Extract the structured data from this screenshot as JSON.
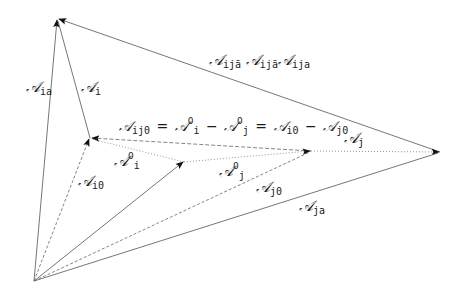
{
  "diagram": {
    "type": "vector-diagram",
    "points": {
      "origin": [
        34,
        281
      ],
      "top": [
        57,
        18
      ],
      "i0": [
        90,
        138
      ],
      "center": [
        184,
        162
      ],
      "j0": [
        311,
        151
      ],
      "right": [
        440,
        152
      ]
    },
    "labels": {
      "A_ia": {
        "base": "𝒜",
        "sub": "ia"
      },
      "A_i": {
        "base": "𝒜",
        "sub": "i"
      },
      "A_i0": {
        "base": "𝒜",
        "sub": "i0"
      },
      "A_i_sup": {
        "base": "𝒜",
        "sub": "i",
        "sup": "0"
      },
      "A_j_sup": {
        "base": "𝒜",
        "sub": "j",
        "sup": "0"
      },
      "A_j0": {
        "base": "𝒜",
        "sub": "j0"
      },
      "A_ja": {
        "base": "𝒜",
        "sub": "ja"
      },
      "A_j": {
        "base": "𝒜",
        "sub": "j"
      },
      "A_ija_top": {
        "text1_base": "𝒜",
        "text1_sub": "ijā",
        "text2_base": "𝒜",
        "text2_sub": "ijā",
        "text3_base": "𝒜",
        "text3_sub": "ija"
      },
      "equation": {
        "lhs_base": "𝒜",
        "lhs_sub": "ij0",
        "eq1": "=",
        "t1_base": "𝒜",
        "t1_sub": "i",
        "t1_sup": "0",
        "minus1": "−",
        "t2_base": "𝒜",
        "t2_sub": "j",
        "t2_sup": "0",
        "eq2": "=",
        "t3_base": "𝒜",
        "t3_sub": "i0",
        "minus2": "−",
        "t4_base": "𝒜",
        "t4_sub": "j0"
      }
    },
    "colors": {
      "line": "#555555",
      "arrow": "#111111",
      "text": "#1a1a1a"
    }
  }
}
